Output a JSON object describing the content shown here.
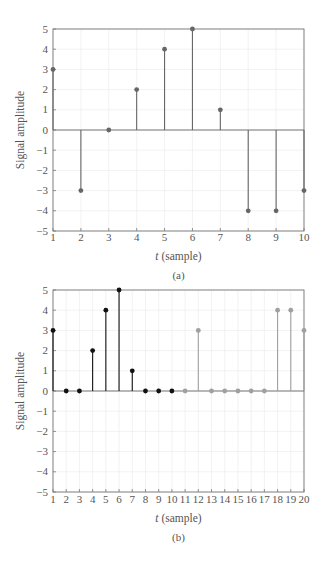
{
  "chart_data": [
    {
      "type": "stem",
      "id": "a",
      "caption": "(a)",
      "xlabel_italic": "t",
      "xlabel_rest": " (sample)",
      "ylabel": "Signal amplitude",
      "xlim": [
        1,
        10
      ],
      "ylim": [
        -5,
        5
      ],
      "xticks": [
        1,
        2,
        3,
        4,
        5,
        6,
        7,
        8,
        9,
        10
      ],
      "yticks": [
        5,
        4,
        3,
        2,
        1,
        0,
        -1,
        -2,
        -3,
        -4,
        -5
      ],
      "grid": true,
      "series": [
        {
          "name": "signal",
          "color": "#666666",
          "x": [
            1,
            2,
            3,
            4,
            5,
            6,
            7,
            8,
            9,
            10
          ],
          "values": [
            3,
            -3,
            0,
            2,
            4,
            5,
            1,
            -4,
            -4,
            -3
          ]
        }
      ]
    },
    {
      "type": "stem",
      "id": "b",
      "caption": "(b)",
      "xlabel_italic": "t",
      "xlabel_rest": " (sample)",
      "ylabel": "Signal amplitude",
      "xlim": [
        1,
        20
      ],
      "ylim": [
        -5,
        5
      ],
      "xticks": [
        1,
        2,
        3,
        4,
        5,
        6,
        7,
        8,
        9,
        10,
        11,
        12,
        13,
        14,
        15,
        16,
        17,
        18,
        19,
        20
      ],
      "yticks": [
        5,
        4,
        3,
        2,
        1,
        0,
        -1,
        -2,
        -3,
        -4,
        -5
      ],
      "grid": true,
      "series": [
        {
          "name": "first half",
          "color": "#111111",
          "x": [
            1,
            2,
            3,
            4,
            5,
            6,
            7,
            8,
            9,
            10
          ],
          "values": [
            3,
            0,
            0,
            2,
            4,
            5,
            1,
            0,
            0,
            0
          ]
        },
        {
          "name": "second half",
          "color": "#a0a0a0",
          "x": [
            11,
            12,
            13,
            14,
            15,
            16,
            17,
            18,
            19,
            20
          ],
          "values": [
            0,
            3,
            0,
            0,
            0,
            0,
            0,
            4,
            4,
            3
          ]
        }
      ]
    }
  ],
  "layout": {
    "charts": [
      {
        "left": 53,
        "right": 304,
        "top": 29,
        "bottom": 231,
        "tickY": 241,
        "xlabelY": 260,
        "captionY": 279
      },
      {
        "left": 53,
        "right": 304,
        "top": 290,
        "bottom": 492,
        "tickY": 503,
        "xlabelY": 522,
        "captionY": 541
      }
    ]
  }
}
